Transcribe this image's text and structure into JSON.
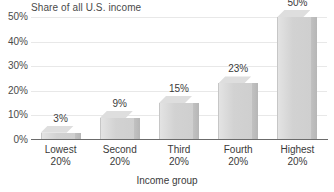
{
  "chart_data": {
    "type": "bar",
    "title": "Share of all U.S. income",
    "xlabel": "Income group",
    "ylabel": "",
    "categories": [
      "Lowest 20%",
      "Second 20%",
      "Third 20%",
      "Fourth 20%",
      "Highest 20%"
    ],
    "category_lines": [
      {
        "line1": "Lowest",
        "line2": "20%"
      },
      {
        "line1": "Second",
        "line2": "20%"
      },
      {
        "line1": "Third",
        "line2": "20%"
      },
      {
        "line1": "Fourth",
        "line2": "20%"
      },
      {
        "line1": "Highest",
        "line2": "20%"
      }
    ],
    "values": [
      3,
      9,
      15,
      23,
      50
    ],
    "data_labels": [
      "3%",
      "9%",
      "15%",
      "23%",
      "50%"
    ],
    "ylim": [
      0,
      50
    ],
    "ytick_values": [
      0,
      10,
      20,
      30,
      40,
      50
    ],
    "ytick_labels": [
      "0%",
      "10%",
      "20%",
      "30%",
      "40%",
      "50%"
    ],
    "grid": true,
    "legend": "none",
    "style": {
      "bar_face_color": "#d4d4d4",
      "bar_side_color": "#bababa",
      "bar_top_color": "#dedede",
      "gridline_color": "#e8e8e8",
      "axis_color": "#6b6b6b",
      "text_color": "#3a3a3a",
      "background": "#ffffff"
    }
  }
}
